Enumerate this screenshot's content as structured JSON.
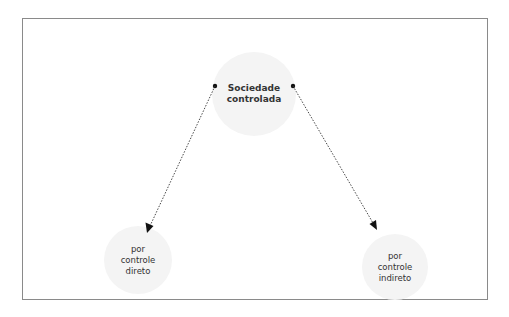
{
  "diagram": {
    "nodes": [
      {
        "id": "top",
        "lines": [
          "Sociedade",
          "controlada"
        ]
      },
      {
        "id": "left",
        "lines": [
          "por",
          "controle",
          "direto"
        ]
      },
      {
        "id": "right",
        "lines": [
          "por",
          "controle",
          "indireto"
        ]
      }
    ],
    "edges": [
      {
        "from": "top",
        "to": "left",
        "style": "dotted",
        "arrow": "filled-triangle"
      },
      {
        "from": "top",
        "to": "right",
        "style": "dotted",
        "arrow": "filled-triangle"
      }
    ],
    "colors": {
      "border": "#8a8a8a",
      "node_fill": "#f4f4f4",
      "text": "#333333",
      "line": "#333333"
    }
  }
}
